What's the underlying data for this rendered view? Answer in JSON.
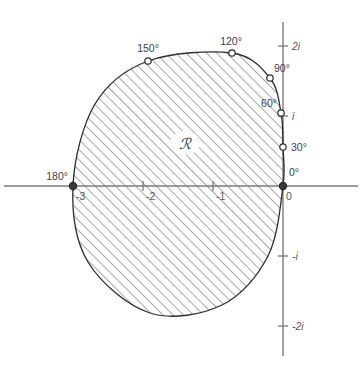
{
  "figure": {
    "region_label": "ℛ",
    "background_color": "#ffffff",
    "curve_color": "#2b2b2b",
    "axis_color": "#7a7a82",
    "hatch_color": "#5a5a62"
  },
  "axes": {
    "real_axis_name": "real-axis",
    "imaginary_axis_name": "imaginary-axis",
    "origin": {
      "x": 283,
      "y": 186
    },
    "unit_px": 70,
    "real_ticks": [
      {
        "label": "-3",
        "value": -3,
        "x": 73
      },
      {
        "label": "-2",
        "value": -2,
        "x": 143
      },
      {
        "label": "-1",
        "value": -1,
        "x": 213
      },
      {
        "label": "0",
        "value": 0,
        "x": 283
      }
    ],
    "imaginary_ticks": [
      {
        "label": "2i",
        "value": 2,
        "y": 46
      },
      {
        "label": "i",
        "value": 1,
        "y": 116
      },
      {
        "label": "-i",
        "value": -1,
        "y": 256
      },
      {
        "label": "-2i",
        "value": -2,
        "y": 326
      }
    ]
  },
  "angle_markers": [
    {
      "label": "0°",
      "angle": 0,
      "cx": 283,
      "cy": 186,
      "lx": 289,
      "ly": 176,
      "anchor": "start",
      "filled": true
    },
    {
      "label": "30°",
      "angle": 30,
      "cx": 283,
      "cy": 147,
      "lx": 291,
      "ly": 151,
      "anchor": "start",
      "filled": false
    },
    {
      "label": "60°",
      "angle": 60,
      "cx": 281,
      "cy": 113,
      "lx": 277,
      "ly": 107,
      "anchor": "end",
      "filled": false
    },
    {
      "label": "90°",
      "angle": 90,
      "cx": 270,
      "cy": 78,
      "lx": 274,
      "ly": 72,
      "anchor": "start",
      "filled": false
    },
    {
      "label": "120°",
      "angle": 120,
      "cx": 232,
      "cy": 53,
      "lx": 231,
      "ly": 45,
      "anchor": "middle",
      "filled": false
    },
    {
      "label": "150°",
      "angle": 150,
      "cx": 148,
      "cy": 61,
      "lx": 148,
      "ly": 52,
      "anchor": "middle",
      "filled": false
    },
    {
      "label": "180°",
      "angle": 180,
      "cx": 73,
      "cy": 186,
      "lx": 68,
      "ly": 180,
      "anchor": "end",
      "filled": true
    }
  ],
  "contour": {
    "name": "region-boundary",
    "description": "closed curve bounding the shaded region",
    "points": [
      {
        "x": 283,
        "y": 186
      },
      {
        "x": 283,
        "y": 147
      },
      {
        "x": 281,
        "y": 113
      },
      {
        "x": 270,
        "y": 78
      },
      {
        "x": 232,
        "y": 53
      },
      {
        "x": 148,
        "y": 61
      },
      {
        "x": 95,
        "y": 104
      },
      {
        "x": 73,
        "y": 186
      },
      {
        "x": 88,
        "y": 262
      },
      {
        "x": 150,
        "y": 313
      },
      {
        "x": 222,
        "y": 305
      },
      {
        "x": 268,
        "y": 256
      },
      {
        "x": 283,
        "y": 186
      }
    ]
  },
  "region_marker": {
    "x": 185,
    "y": 146
  }
}
